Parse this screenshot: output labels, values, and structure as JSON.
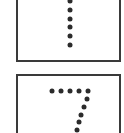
{
  "cards": [
    {
      "digit": "1",
      "box": {
        "left": 16,
        "top": -4,
        "width": 105,
        "height": 66
      },
      "dots": [
        [
          70,
          1
        ],
        [
          70,
          10
        ],
        [
          70,
          19
        ],
        [
          70,
          27
        ],
        [
          70,
          36
        ],
        [
          70,
          45
        ]
      ]
    },
    {
      "digit": "7",
      "box": {
        "left": 16,
        "top": 74,
        "width": 105,
        "height": 66
      },
      "dots": [
        [
          52,
          91
        ],
        [
          61,
          91
        ],
        [
          70,
          91
        ],
        [
          79,
          91
        ],
        [
          88,
          91
        ],
        [
          87,
          99
        ],
        [
          84,
          107
        ],
        [
          81,
          115
        ],
        [
          79,
          122
        ],
        [
          77,
          130
        ]
      ]
    }
  ],
  "colors": {
    "border": "#3a3a3a",
    "dot": "#2b2b2b",
    "background": "#ffffff"
  }
}
